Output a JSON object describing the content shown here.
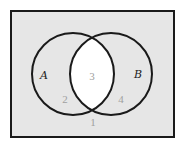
{
  "diagram": {
    "type": "venn",
    "universe": {
      "x": 11,
      "y": 11,
      "width": 163,
      "height": 126,
      "fill": "#e6e6e6",
      "stroke": "#1a1a1a"
    },
    "sets": [
      {
        "name": "A",
        "label": "A",
        "cx": 73,
        "cy": 74,
        "r": 41
      },
      {
        "name": "B",
        "label": "B",
        "cx": 111,
        "cy": 74,
        "r": 41
      }
    ],
    "highlight": {
      "region": "A∩B",
      "fill": "#ffffff"
    },
    "regions": [
      {
        "id": "1",
        "label": "1",
        "description": "outside A and B"
      },
      {
        "id": "2",
        "label": "2",
        "description": "A only"
      },
      {
        "id": "3",
        "label": "3",
        "description": "A and B"
      },
      {
        "id": "4",
        "label": "4",
        "description": "B only"
      }
    ],
    "colors": {
      "outline": "#1a1a1a",
      "region_text": "#a0a0a0",
      "set_text": "#222222"
    }
  }
}
